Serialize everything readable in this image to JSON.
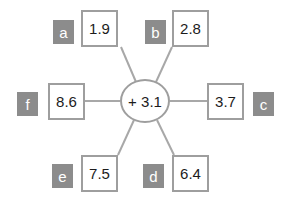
{
  "diagram": {
    "type": "hub-and-spoke",
    "hub": {
      "label": "+ 3.1",
      "operator": "+",
      "value": "3.1",
      "cx": 145,
      "cy": 101,
      "rx": 25,
      "ry": 22
    },
    "colors": {
      "line": "#a8a8a8",
      "box_border": "#9e9e9e",
      "box_fill": "#ffffff",
      "label_fill": "#8c8c8c",
      "label_text": "#ffffff",
      "value_text": "#1c1c1c",
      "background": "#ffffff"
    },
    "nodes": [
      {
        "id": "a",
        "letter": "a",
        "value": "1.9",
        "box_x": 81,
        "box_y": 10,
        "label_x": 53,
        "label_y": 20,
        "spoke": {
          "x1": 121,
          "y1": 47,
          "x2": 136,
          "y2": 82
        }
      },
      {
        "id": "b",
        "letter": "b",
        "value": "2.8",
        "box_x": 172,
        "box_y": 10,
        "label_x": 145,
        "label_y": 20,
        "spoke": {
          "x1": 172,
          "y1": 47,
          "x2": 156,
          "y2": 82
        }
      },
      {
        "id": "c",
        "letter": "c",
        "value": "3.7",
        "box_x": 207,
        "box_y": 83,
        "label_x": 253,
        "label_y": 92,
        "spoke": {
          "x1": 207,
          "y1": 101,
          "x2": 170,
          "y2": 101
        }
      },
      {
        "id": "d",
        "letter": "d",
        "value": "6.4",
        "box_x": 172,
        "box_y": 155,
        "label_x": 143,
        "label_y": 164,
        "spoke": {
          "x1": 174,
          "y1": 155,
          "x2": 157,
          "y2": 120
        }
      },
      {
        "id": "e",
        "letter": "e",
        "value": "7.5",
        "box_x": 81,
        "box_y": 155,
        "label_x": 52,
        "label_y": 164,
        "spoke": {
          "x1": 118,
          "y1": 155,
          "x2": 134,
          "y2": 120
        }
      },
      {
        "id": "f",
        "letter": "f",
        "value": "8.6",
        "box_x": 48,
        "box_y": 83,
        "label_x": 17,
        "label_y": 92,
        "spoke": {
          "x1": 85,
          "y1": 101,
          "x2": 120,
          "y2": 101
        }
      }
    ]
  }
}
